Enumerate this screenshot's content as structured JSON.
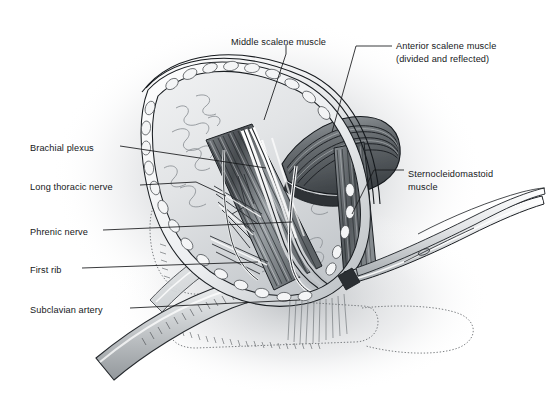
{
  "figure": {
    "kind": "medical-illustration",
    "style": "grayscale pen-and-ink / airbrush anatomical drawing",
    "background_color": "#ffffff",
    "ink_color": "#16181a",
    "shade_light": "#e9eaec",
    "shade_mid": "#bfc3c7",
    "shade_dark": "#6d7277",
    "shade_darkest": "#3a3e42"
  },
  "labels": [
    {
      "id": "middle-scalene-muscle",
      "lines": [
        "Middle scalene muscle"
      ],
      "x": 231,
      "y": 36,
      "align": "left",
      "leader": "vertical drop from text down to muscle belly"
    },
    {
      "id": "anterior-scalene-muscle",
      "lines": [
        "Anterior scalene muscle",
        "(divided and reflected)"
      ],
      "x": 396,
      "y": 40,
      "align": "left",
      "leader": "elbowed line left then diagonally down-left to reflected muscle flap"
    },
    {
      "id": "brachial-plexus",
      "lines": [
        "Brachial plexus"
      ],
      "x": 30,
      "y": 142,
      "align": "left",
      "leader": "horizontal line right to nerve trunks in wound"
    },
    {
      "id": "sternocleidomastoid-muscle",
      "lines": [
        "Sternocleidomastoid",
        "muscle"
      ],
      "x": 408,
      "y": 168,
      "align": "left",
      "leader": "elbowed line left then down-left to muscle edge"
    },
    {
      "id": "long-thoracic-nerve",
      "lines": [
        "Long thoracic nerve"
      ],
      "x": 30,
      "y": 181,
      "align": "left",
      "leader": "horizontal line right to nerve"
    },
    {
      "id": "phrenic-nerve",
      "lines": [
        "Phrenic nerve"
      ],
      "x": 30,
      "y": 226,
      "align": "left",
      "leader": "horizontal line right to nerve on anterior scalene"
    },
    {
      "id": "first-rib",
      "lines": [
        "First rib"
      ],
      "x": 30,
      "y": 264,
      "align": "left",
      "leader": "horizontal line right to rib"
    },
    {
      "id": "subclavian-artery",
      "lines": [
        "Subclavian artery"
      ],
      "x": 30,
      "y": 304,
      "align": "left",
      "leader": "horizontal line right to artery"
    }
  ],
  "structures": [
    {
      "name": "skin-incision-oval",
      "note": "lens/oval shaped retracted wound with scalloped subcutaneous fat edge"
    },
    {
      "name": "middle-scalene-muscle",
      "note": "dark striated muscle belly running obliquely across wound"
    },
    {
      "name": "anterior-scalene-muscle-flap",
      "note": "banded muscle, divided and reflected superolaterally"
    },
    {
      "name": "brachial-plexus-trunks",
      "note": "pale cord-like nerve trunks emerging between scalenes"
    },
    {
      "name": "phrenic-nerve",
      "note": "fine nerve crossing anterior scalene"
    },
    {
      "name": "long-thoracic-nerve",
      "note": "nerve passing through middle scalene"
    },
    {
      "name": "first-rib",
      "note": "stippled bone outline beneath plexus"
    },
    {
      "name": "subclavian-artery",
      "note": "tubular vessel at inferior wound"
    },
    {
      "name": "sternocleidomastoid-muscle",
      "note": "retracted muscle at medial wound edge"
    },
    {
      "name": "surgical-clamp",
      "note": "hemostat/forceps entering from lower right"
    },
    {
      "name": "clavicle-ghost",
      "note": "dotted outline of clavicle at lower field"
    },
    {
      "name": "background-shading",
      "note": "soft gray radial airbrush halo behind the field"
    }
  ]
}
